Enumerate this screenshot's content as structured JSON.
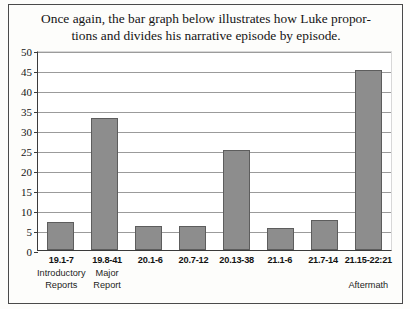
{
  "caption": {
    "line1": "Once again, the bar graph below illustrates how Luke propor-",
    "line2": "tions and divides his narrative episode by episode."
  },
  "annotation": {
    "bracket_label": "Series of Summary Reports"
  },
  "chart_data": {
    "type": "bar",
    "title": "",
    "xlabel": "",
    "ylabel": "",
    "ylim": [
      0,
      50
    ],
    "ytick_step": 5,
    "grid": true,
    "legend": "none",
    "bar_color": "#8d8d8d",
    "bar_edge_color": "#5d5d5d",
    "yticks": [
      "0",
      "5",
      "10",
      "15",
      "20",
      "25",
      "30",
      "35",
      "40",
      "45",
      "50"
    ],
    "categories": [
      "19.1-7",
      "19.8-41",
      "20.1-6",
      "20.7-12",
      "20.13-38",
      "21.1-6",
      "21.7-14",
      "21.15-22:21"
    ],
    "category_descriptions": [
      "Introductory Reports",
      "Major Report",
      "",
      "",
      "",
      "",
      "",
      "Aftermath"
    ],
    "category_description_lines": [
      [
        "Introductory",
        "Reports"
      ],
      [
        "Major",
        "Report"
      ],
      [
        "",
        ""
      ],
      [
        "",
        ""
      ],
      [
        "",
        ""
      ],
      [
        "",
        ""
      ],
      [
        "",
        ""
      ],
      [
        "",
        "Aftermath"
      ]
    ],
    "values": [
      7,
      33,
      6,
      6,
      25,
      5.5,
      7.5,
      45
    ]
  }
}
